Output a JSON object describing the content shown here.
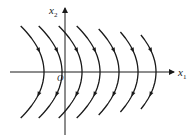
{
  "figure": {
    "type": "phase-portrait",
    "axes": {
      "x1_label": "x",
      "x1_sub": "1",
      "x2_label": "x",
      "x2_sub": "2",
      "origin_label": "O"
    },
    "trajectories": {
      "shape": "parabolas opening to the left, vertices on x1 axis",
      "count": 7,
      "vertex_x_px": [
        44,
        62,
        82,
        100,
        119,
        138,
        156
      ],
      "flow_direction": "top-left toward vertex, then toward bottom-left"
    },
    "colors": {
      "stroke": "#1a1a1a",
      "background": "#ffffff"
    }
  }
}
